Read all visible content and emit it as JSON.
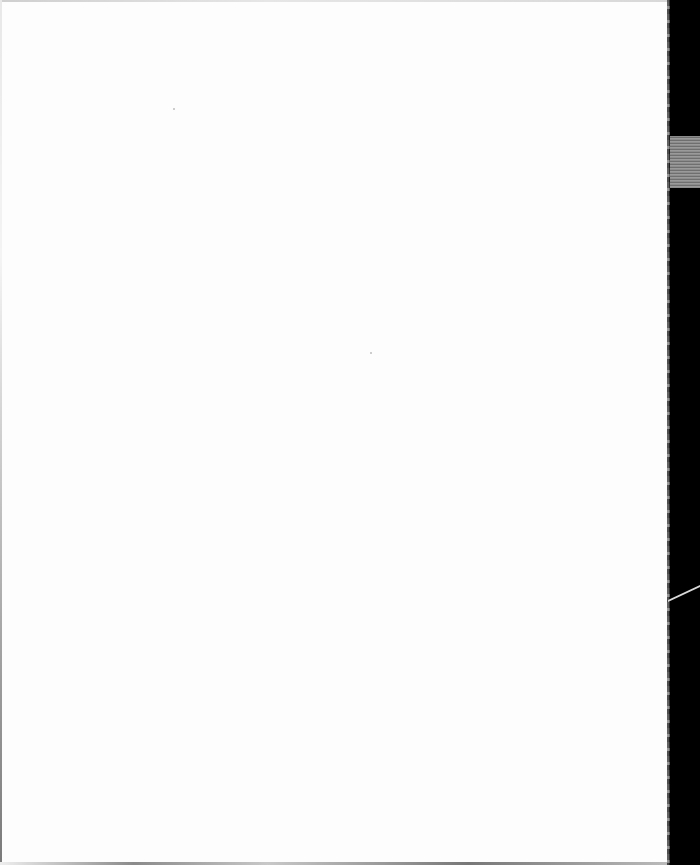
{
  "document": {
    "type": "scanned-page",
    "state": "blank",
    "text_content": ""
  },
  "colors": {
    "paper": "#fdfdfd",
    "scanner_background": "#000000",
    "calibration_strip": "#8c8c8c"
  }
}
